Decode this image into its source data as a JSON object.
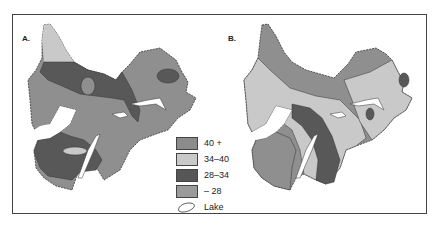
{
  "panels": [
    {
      "label": "A."
    },
    {
      "label": "B."
    }
  ],
  "legend": {
    "items": [
      {
        "label": "40 +",
        "color": "#8c8c8c"
      },
      {
        "label": "34–40",
        "color": "#c9c9c9"
      },
      {
        "label": "28–34",
        "color": "#565656"
      },
      {
        "label": "– 28",
        "color": "#9a9a9a"
      }
    ],
    "lake_label": "Lake"
  }
}
